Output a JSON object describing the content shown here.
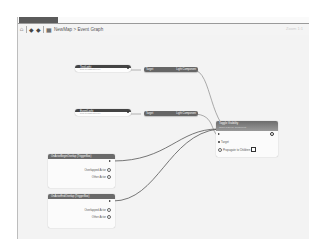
{
  "tab": {
    "label": "NewMap"
  },
  "toolbar": {
    "icons": [
      "home-icon",
      "back-arrow-icon",
      "forward-arrow-icon",
      "graph-icon"
    ],
    "breadcrumb": {
      "map": "NewMap",
      "separator": ">",
      "graph": "Event Graph"
    },
    "zoom_label": "Zoom 1:1"
  },
  "graph": {
    "variable_nodes": [
      {
        "title": "TestLight",
        "subtitle": "from Persistent Level"
      },
      {
        "title": "EventLight",
        "subtitle": "from Persistent Level"
      }
    ],
    "get_nodes": [
      {
        "input": "Target",
        "output": "Light Component"
      },
      {
        "input": "Target",
        "output": "Light Component"
      }
    ],
    "event_nodes": [
      {
        "title": "OnActorBeginOverlap (TriggerBox)",
        "pins": [
          "Overlapped Actor",
          "Other Actor"
        ]
      },
      {
        "title": "OnActorEndOverlap (TriggerBox)",
        "pins": [
          "Overlapped Actor",
          "Other Actor"
        ]
      }
    ],
    "function_node": {
      "title": "Toggle Visibility",
      "subtitle": "Target is Scene Component",
      "pins": {
        "target": "Target",
        "propagate": "Propagate to Children"
      }
    }
  }
}
